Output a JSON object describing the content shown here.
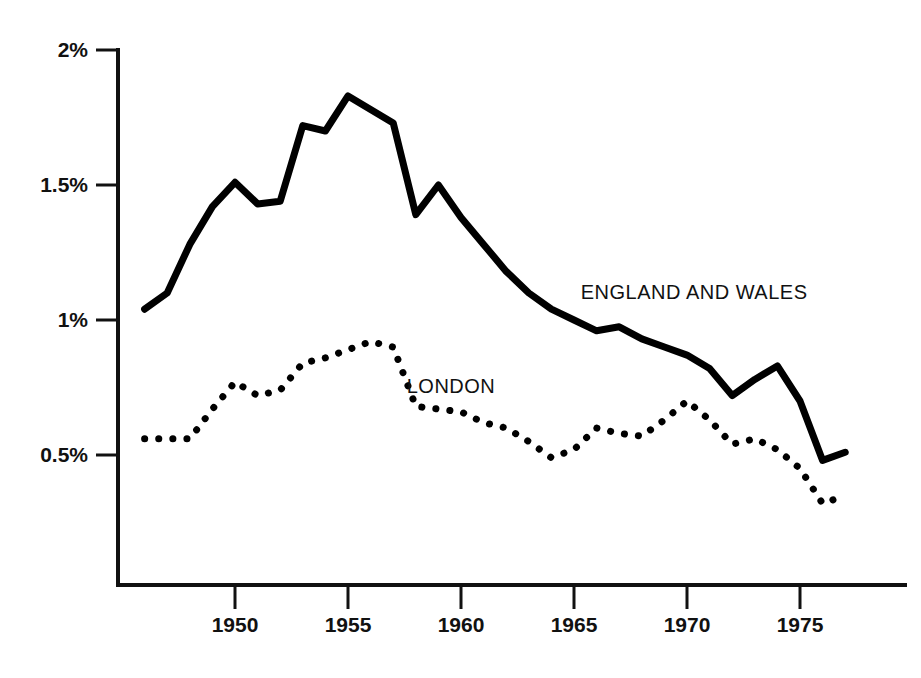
{
  "chart_data": {
    "type": "line",
    "title": "",
    "subtitle": "",
    "xlabel": "",
    "ylabel": "",
    "xlim": [
      1946,
      1977
    ],
    "ylim": [
      0,
      2
    ],
    "grid": false,
    "legend_position": "inline-annotation",
    "y_ticks": [
      {
        "value": 2,
        "label": "2%"
      },
      {
        "value": 1.5,
        "label": "1.5%"
      },
      {
        "value": 1,
        "label": "1%"
      },
      {
        "value": 0.5,
        "label": "0.5%"
      }
    ],
    "x_ticks": [
      {
        "value": 1950,
        "label": "1950"
      },
      {
        "value": 1955,
        "label": "1955"
      },
      {
        "value": 1960,
        "label": "1960"
      },
      {
        "value": 1965,
        "label": "1965"
      },
      {
        "value": 1970,
        "label": "1970"
      },
      {
        "value": 1975,
        "label": "1975"
      }
    ],
    "x": [
      1946,
      1947,
      1948,
      1949,
      1950,
      1951,
      1952,
      1953,
      1954,
      1955,
      1956,
      1957,
      1958,
      1959,
      1960,
      1961,
      1962,
      1963,
      1964,
      1965,
      1966,
      1967,
      1968,
      1969,
      1970,
      1971,
      1972,
      1973,
      1974,
      1975,
      1976,
      1977
    ],
    "series": [
      {
        "name": "ENGLAND AND WALES",
        "style": "solid",
        "color": "#000000",
        "values": [
          1.04,
          1.1,
          1.28,
          1.42,
          1.51,
          1.43,
          1.44,
          1.72,
          1.7,
          1.83,
          1.78,
          1.73,
          1.39,
          1.5,
          1.38,
          1.28,
          1.18,
          1.1,
          1.04,
          1.0,
          0.96,
          0.975,
          0.93,
          0.9,
          0.87,
          0.82,
          0.72,
          0.78,
          0.83,
          0.7,
          0.48,
          0.51
        ]
      },
      {
        "name": "LONDON",
        "style": "dotted",
        "color": "#000000",
        "values": [
          0.56,
          0.56,
          0.56,
          0.67,
          0.77,
          0.72,
          0.74,
          0.84,
          0.86,
          0.89,
          0.92,
          0.9,
          0.68,
          0.67,
          0.66,
          0.62,
          0.6,
          0.55,
          0.49,
          0.52,
          0.6,
          0.58,
          0.57,
          0.63,
          0.7,
          0.63,
          0.54,
          0.56,
          0.52,
          0.45,
          0.32,
          0.35
        ]
      }
    ],
    "annotations": [
      {
        "text": "ENGLAND AND WALES",
        "x": 1965.3,
        "y": 1.145
      },
      {
        "text": "LONDON",
        "x": 1957.6,
        "y": 0.795
      }
    ]
  },
  "axis": {
    "line_color": "#111111",
    "line_width": 4
  }
}
